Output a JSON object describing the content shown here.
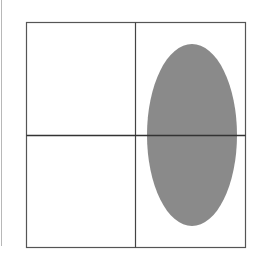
{
  "diagram": {
    "type": "quadrant-grid-with-ellipse",
    "frame": {
      "x": 26,
      "y": 22,
      "width": 220,
      "height": 226,
      "stroke": "#555555"
    },
    "dividers": {
      "vertical_x": 135,
      "horizontal_y": 135,
      "stroke": "#444444"
    },
    "ellipse": {
      "cx": 192,
      "cy": 135,
      "rx": 45,
      "ry": 91,
      "fill": "#8a8a8a",
      "quadrants_covered": [
        "top-right",
        "bottom-right"
      ]
    },
    "left_edge_line": {
      "x": 1,
      "color": "#b8b8b8"
    }
  }
}
